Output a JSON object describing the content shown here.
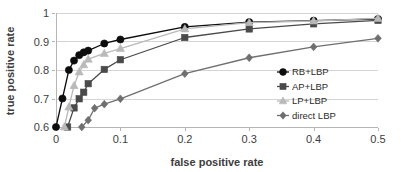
{
  "chart_data": {
    "type": "line",
    "title": "",
    "xlabel": "false positive rate",
    "ylabel": "true positive rate",
    "xlim": [
      0,
      0.5
    ],
    "ylim": [
      0.6,
      1
    ],
    "xticks": [
      "0",
      "0.1",
      "0.2",
      "0.3",
      "0.4",
      "0.5"
    ],
    "xtick_values": [
      0,
      0.1,
      0.2,
      0.3,
      0.4,
      0.5
    ],
    "yticks": [
      "0.6",
      "0.7",
      "0.8",
      "0.9",
      "1"
    ],
    "ytick_values": [
      0.6,
      0.7,
      0.8,
      0.9,
      1.0
    ],
    "grid": "horizontal",
    "legend_position": "center-right",
    "series": [
      {
        "name": "RB+LBP",
        "marker": "circle",
        "color": "#0d0d0d",
        "x": [
          0.0,
          0.01,
          0.02,
          0.028,
          0.036,
          0.043,
          0.05,
          0.075,
          0.1,
          0.2,
          0.3,
          0.4,
          0.5
        ],
        "y": [
          0.6,
          0.7,
          0.8,
          0.833,
          0.852,
          0.862,
          0.868,
          0.893,
          0.907,
          0.951,
          0.968,
          0.973,
          0.979
        ]
      },
      {
        "name": "AP+LBP",
        "marker": "square",
        "color": "#4a4a4a",
        "x": [
          0.018,
          0.028,
          0.036,
          0.043,
          0.05,
          0.075,
          0.1,
          0.2,
          0.3,
          0.4,
          0.5
        ],
        "y": [
          0.6,
          0.667,
          0.699,
          0.722,
          0.752,
          0.802,
          0.836,
          0.914,
          0.944,
          0.962,
          0.974
        ]
      },
      {
        "name": "LP+LBP",
        "marker": "triangle",
        "color": "#b9b9b9",
        "x": [
          0.013,
          0.02,
          0.028,
          0.036,
          0.043,
          0.05,
          0.075,
          0.1,
          0.2,
          0.3,
          0.4,
          0.5
        ],
        "y": [
          0.6,
          0.67,
          0.745,
          0.793,
          0.818,
          0.838,
          0.858,
          0.875,
          0.944,
          0.966,
          0.972,
          0.981
        ]
      },
      {
        "name": "direct LBP",
        "marker": "diamond",
        "color": "#6f6f6f",
        "x": [
          0.04,
          0.05,
          0.06,
          0.075,
          0.1,
          0.2,
          0.3,
          0.4,
          0.5
        ],
        "y": [
          0.6,
          0.624,
          0.666,
          0.68,
          0.699,
          0.787,
          0.843,
          0.881,
          0.911
        ]
      }
    ]
  },
  "legend": {
    "items": [
      {
        "label": "RB+LBP"
      },
      {
        "label": "AP+LBP"
      },
      {
        "label": "LP+LBP"
      },
      {
        "label": "direct LBP"
      }
    ]
  }
}
